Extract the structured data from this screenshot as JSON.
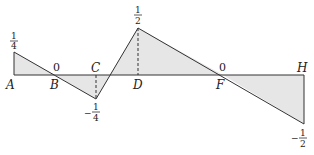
{
  "diagram": {
    "baseline_y": 75,
    "fill_color": "#e6e6e6",
    "line_color": "#333333",
    "points": {
      "A": {
        "label": "A",
        "x": 14,
        "value_label": {
          "num": "1",
          "den": "4",
          "sign": ""
        }
      },
      "B": {
        "label": "B",
        "x": 55,
        "zero_label": "0"
      },
      "C": {
        "label": "C",
        "x": 96,
        "value_label": {
          "num": "1",
          "den": "4",
          "sign": "−"
        }
      },
      "D": {
        "label": "D",
        "x": 138,
        "value_label": {
          "num": "1",
          "den": "2",
          "sign": ""
        }
      },
      "F": {
        "label": "F",
        "x": 223,
        "zero_label": "0"
      },
      "H": {
        "label": "H",
        "x": 304,
        "value_label": {
          "num": "1",
          "den": "2",
          "sign": "−"
        }
      }
    },
    "polyline": [
      [
        14,
        52
      ],
      [
        96,
        99
      ],
      [
        138,
        28
      ],
      [
        304,
        124
      ]
    ],
    "regions": [
      {
        "name": "triangle-A-B",
        "sign": "positive"
      },
      {
        "name": "triangle-B-C-cross",
        "sign": "negative"
      },
      {
        "name": "triangle-cross-D-F",
        "sign": "positive"
      },
      {
        "name": "triangle-F-H",
        "sign": "negative"
      }
    ]
  }
}
